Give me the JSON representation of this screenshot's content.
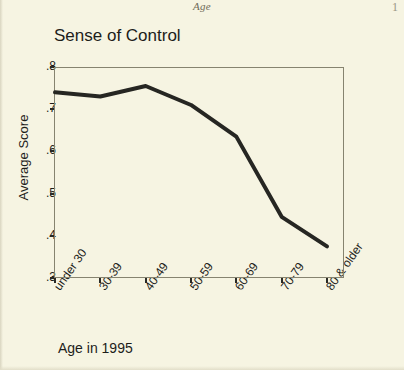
{
  "page": {
    "header_note": "Age",
    "page_number_fragment": "1"
  },
  "chart_data": {
    "type": "line",
    "title": "Sense of Control",
    "xlabel": "Age in 1995",
    "ylabel": "Average Score",
    "categories": [
      "under 30",
      "30-39",
      "40-49",
      "50-59",
      "60-69",
      "70-79",
      "80 & older"
    ],
    "values": [
      0.74,
      0.73,
      0.755,
      0.71,
      0.635,
      0.445,
      0.375
    ],
    "ylim": [
      0.3,
      0.8
    ],
    "ytick_labels": [
      ".8",
      ".7",
      ".6",
      ".5",
      ".4",
      ".3"
    ],
    "ytick_values": [
      0.8,
      0.7,
      0.6,
      0.5,
      0.4,
      0.3
    ],
    "grid": false,
    "legend": "none",
    "line_color": "#262622",
    "line_width": 4,
    "background_color": "#f6f4e2",
    "axis_color": "#86836f"
  }
}
